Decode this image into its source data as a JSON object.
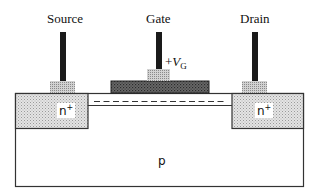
{
  "terminals": {
    "source": {
      "label": "Source"
    },
    "gate": {
      "label": "Gate",
      "voltage_prefix": "+",
      "voltage_symbol": "V",
      "voltage_subscript": "G"
    },
    "drain": {
      "label": "Drain"
    }
  },
  "regions": {
    "source_doping": {
      "label": "n",
      "superscript": "+"
    },
    "drain_doping": {
      "label": "n",
      "superscript": "+"
    },
    "substrate": {
      "label": "p"
    }
  },
  "colors": {
    "outline": "#333333",
    "post": "#1a1a1a",
    "pad_fill": "#c8c8c8",
    "gate_fill": "#555555",
    "nplus_fill": "#dcdcdc",
    "background": "#ffffff"
  }
}
